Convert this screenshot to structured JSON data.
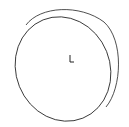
{
  "canvas": {
    "width": 129,
    "height": 127,
    "background": "#ffffff"
  },
  "drawing": {
    "stroke": "#222222",
    "back_ellipse": {
      "cx": 70,
      "cy": 58,
      "rx": 46,
      "ry": 53,
      "rotate": -20
    },
    "front_ellipse": {
      "cx": 64,
      "cy": 68,
      "rx": 46,
      "ry": 53,
      "rotate": -20
    },
    "triad_label": "L"
  }
}
